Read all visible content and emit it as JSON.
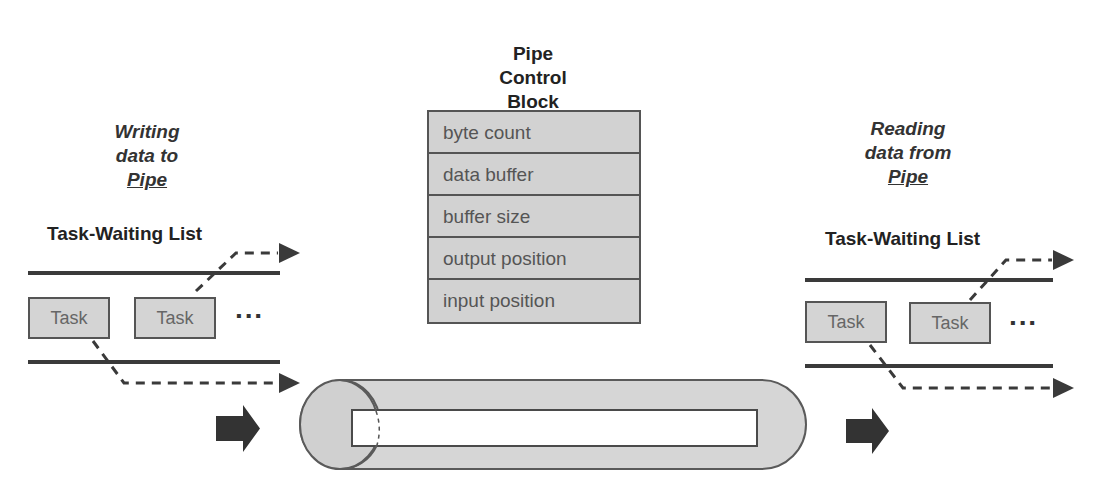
{
  "diagram": {
    "title": "Pipe Control Block",
    "pcb": {
      "title_lines": [
        "Pipe",
        "Control",
        "Block"
      ],
      "fields": [
        "byte count",
        "data buffer",
        "buffer size",
        "output position",
        "input position"
      ]
    },
    "writer": {
      "caption_lines": [
        "Writing",
        "data to"
      ],
      "caption_underlined": "Pipe",
      "list_title": "Task-Waiting List",
      "tasks": [
        "Task",
        "Task"
      ],
      "ellipsis": "▪▪▪"
    },
    "reader": {
      "caption_lines": [
        "Reading",
        "data from"
      ],
      "caption_underlined": "Pipe",
      "list_title": "Task-Waiting List",
      "tasks": [
        "Task",
        "Task"
      ],
      "ellipsis": "▪▪▪"
    },
    "pipe": {
      "label": "",
      "flow_arrows": [
        "input-arrow",
        "output-arrow"
      ]
    },
    "colors": {
      "fill_gray": "#d2d2d2",
      "stroke": "#555555",
      "arrow": "#3a3a3a",
      "text": "#333333"
    }
  }
}
